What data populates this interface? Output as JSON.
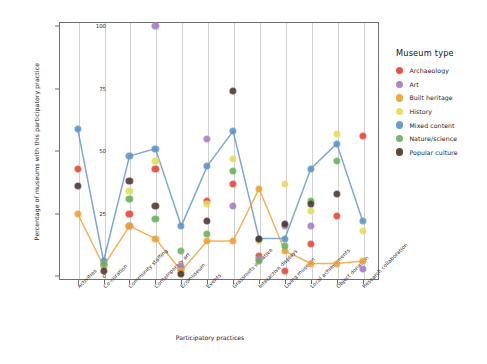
{
  "chart_data": {
    "type": "scatter",
    "title": "",
    "xlabel": "Participatory practices",
    "ylabel": "Percentage of museums with this participatory practice",
    "ylim": [
      0,
      100
    ],
    "yticks": [
      0,
      25,
      50,
      75,
      100
    ],
    "grid": "vertical",
    "legend_position": "right",
    "legend_title": "Museum type",
    "categories": [
      "Activities",
      "Co-curation",
      "Community staffing",
      "Contemporary art",
      "Ecomuseum",
      "Events",
      "Grassroots initiative",
      "Interactive displays",
      "Living museum",
      "Local achievements",
      "Object donation",
      "Research collaboration"
    ],
    "series": [
      {
        "name": "Archaeology",
        "color": "#e8422e",
        "values": [
          43,
          5,
          25,
          43,
          3,
          30,
          37,
          8,
          2,
          13,
          24,
          56
        ]
      },
      {
        "name": "Art",
        "color": "#a579c4",
        "values": [
          null,
          4,
          20,
          100,
          4,
          55,
          28,
          7,
          20,
          20,
          null,
          3
        ]
      },
      {
        "name": "Built heritage",
        "color": "#f0a030",
        "values": [
          25,
          4,
          20,
          15,
          2,
          14,
          14,
          35,
          10,
          5,
          5,
          6
        ]
      },
      {
        "name": "History",
        "color": "#e3dc58",
        "values": [
          null,
          5,
          34,
          46,
          1,
          29,
          47,
          14,
          37,
          26,
          57,
          18
        ]
      },
      {
        "name": "Mixed content",
        "color": "#5b93c7",
        "values": [
          59,
          6,
          48,
          51,
          20,
          44,
          58,
          15,
          15,
          43,
          53,
          22
        ]
      },
      {
        "name": "Nature/science",
        "color": "#67b057",
        "values": [
          null,
          5,
          31,
          23,
          10,
          17,
          42,
          6,
          12,
          30,
          46,
          null
        ]
      },
      {
        "name": "Popular culture",
        "color": "#49342a",
        "values": [
          36,
          2,
          38,
          28,
          1,
          22,
          74,
          15,
          21,
          29,
          33,
          null
        ]
      }
    ],
    "connected_series": [
      "Mixed content",
      "Built heritage"
    ]
  }
}
